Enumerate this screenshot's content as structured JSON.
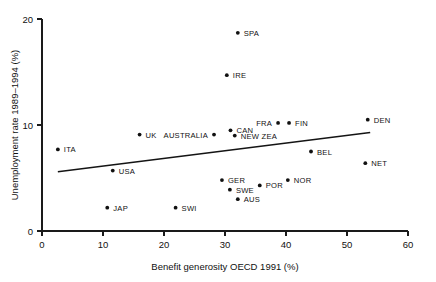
{
  "chart_data": {
    "type": "scatter",
    "title": "",
    "xlabel": "Benefit generosity OECD 1991 (%)",
    "ylabel": "Unemployment rate 1989–1994 (%)",
    "xlim": [
      0,
      60
    ],
    "ylim": [
      0,
      20
    ],
    "xticks": [
      0,
      10,
      20,
      30,
      40,
      50,
      60
    ],
    "yticks": [
      0,
      10,
      20
    ],
    "xticklabels": [
      "0",
      "10",
      "20",
      "30",
      "40",
      "50",
      "60"
    ],
    "yticklabels": [
      "0",
      "10",
      "20"
    ],
    "grid": false,
    "legend": null,
    "points": [
      {
        "label": "ITA",
        "x": 2.6,
        "y": 7.7,
        "label_pos": "right"
      },
      {
        "label": "JAP",
        "x": 10.7,
        "y": 2.2,
        "label_pos": "right"
      },
      {
        "label": "USA",
        "x": 11.6,
        "y": 5.7,
        "label_pos": "right"
      },
      {
        "label": "UK",
        "x": 16.0,
        "y": 9.1,
        "label_pos": "right"
      },
      {
        "label": "SWI",
        "x": 21.9,
        "y": 2.2,
        "label_pos": "right"
      },
      {
        "label": "AUSTRALIA",
        "x": 28.2,
        "y": 9.1,
        "label_pos": "left"
      },
      {
        "label": "GER",
        "x": 29.5,
        "y": 4.8,
        "label_pos": "right"
      },
      {
        "label": "IRE",
        "x": 30.3,
        "y": 14.7,
        "label_pos": "right"
      },
      {
        "label": "SWE",
        "x": 30.8,
        "y": 3.9,
        "label_pos": "right"
      },
      {
        "label": "CAN",
        "x": 30.9,
        "y": 9.5,
        "label_pos": "right"
      },
      {
        "label": "NEW ZEA",
        "x": 31.6,
        "y": 9.0,
        "label_pos": "right"
      },
      {
        "label": "SPA",
        "x": 32.1,
        "y": 18.7,
        "label_pos": "right"
      },
      {
        "label": "AUS",
        "x": 32.1,
        "y": 3.0,
        "label_pos": "right"
      },
      {
        "label": "POR",
        "x": 35.7,
        "y": 4.3,
        "label_pos": "right"
      },
      {
        "label": "FRA",
        "x": 38.7,
        "y": 10.2,
        "label_pos": "left"
      },
      {
        "label": "NOR",
        "x": 40.3,
        "y": 4.8,
        "label_pos": "right"
      },
      {
        "label": "FIN",
        "x": 40.5,
        "y": 10.2,
        "label_pos": "right"
      },
      {
        "label": "BEL",
        "x": 44.1,
        "y": 7.5,
        "label_pos": "right"
      },
      {
        "label": "NET",
        "x": 53.0,
        "y": 6.4,
        "label_pos": "right"
      },
      {
        "label": "DEN",
        "x": 53.4,
        "y": 10.5,
        "label_pos": "right"
      }
    ],
    "trend_line": {
      "x_start": 2.6,
      "y_start": 5.6,
      "x_end": 53.8,
      "y_end": 9.3
    },
    "colors": {
      "marker": "#111111",
      "line": "#141414",
      "axis": "#1a1a1a",
      "background": "#ffffff"
    }
  }
}
